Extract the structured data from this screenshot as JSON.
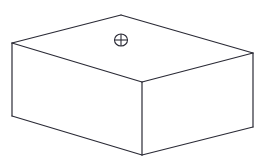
{
  "diagram": {
    "type": "isometric-box-line-drawing",
    "stroke_color": "#2a2a35",
    "background": "#ffffff",
    "vertices": {
      "top_left": [
        12,
        43
      ],
      "top_back": [
        121,
        15
      ],
      "top_right": [
        253,
        53
      ],
      "front_top": [
        142,
        82
      ],
      "front_bottom": [
        142,
        155
      ],
      "bottom_left": [
        12,
        116
      ],
      "bottom_right": [
        253,
        127
      ]
    },
    "symbol": {
      "name": "circle-with-cross",
      "center": [
        121,
        40
      ],
      "radius": 6
    }
  }
}
